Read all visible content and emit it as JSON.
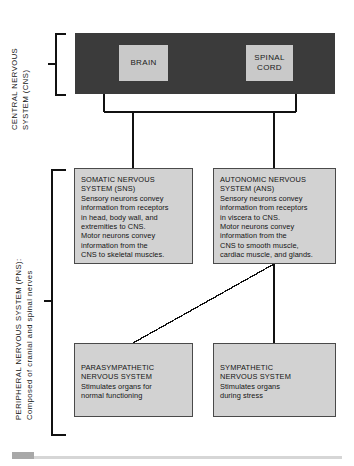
{
  "diagram": {
    "colors": {
      "cns_bar": "#3b3b3b",
      "organ_box": "#c9c9c9",
      "info_box": "#d2d2d2",
      "line": "#111111",
      "footer_rule": "#d6d6d6"
    },
    "side_labels": {
      "cns": "CENTRAL NERVOUS\nSYSTEM (CNS)",
      "pns": "PERIPHERAL NERVOUS SYSTEM (PNS):\nComposed of cranial and spinal nerves"
    },
    "cns_organs": [
      {
        "id": "brain",
        "label": "BRAIN"
      },
      {
        "id": "spinal-cord",
        "label": "SPINAL\nCORD"
      }
    ],
    "divisions": [
      {
        "id": "sns",
        "title": "SOMATIC NERVOUS\nSYSTEM (SNS)",
        "body": "Sensory neurons convey\ninformation from receptors\nin head, body wall, and\nextremities to CNS.\nMotor neurons convey\ninformation from the\nCNS to skeletal muscles."
      },
      {
        "id": "ans",
        "title": "AUTONOMIC NERVOUS\nSYSTEM (ANS)",
        "body": "Sensory neurons convey\ninformation from receptors\nin viscera to CNS.\nMotor neurons convey\ninformation from the\nCNS to smooth muscle,\ncardiac muscle, and glands."
      },
      {
        "id": "parasympathetic",
        "title": "PARASYMPATHETIC\nNERVOUS SYSTEM",
        "body": "Stimulates organs for\nnormal functioning"
      },
      {
        "id": "sympathetic",
        "title": "SYMPATHETIC\nNERVOUS SYSTEM",
        "body": "Stimulates organs\nduring stress"
      }
    ]
  }
}
